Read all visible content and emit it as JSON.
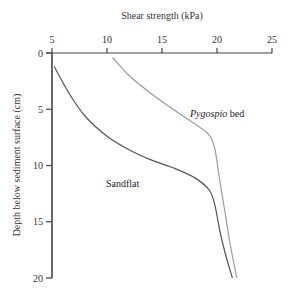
{
  "chart_data": {
    "type": "line",
    "title": "",
    "xlabel": "Shear strength (kPa)",
    "ylabel": "Depth below sediment surface (cm)",
    "xlim": [
      5,
      25
    ],
    "ylim": [
      0,
      20
    ],
    "y_inverted": true,
    "x_axis_position": "top",
    "x_ticks": [
      5,
      10,
      15,
      20,
      25
    ],
    "y_ticks": [
      0,
      5,
      10,
      15,
      20
    ],
    "grid": false,
    "legend": "inline labels",
    "series": [
      {
        "name": "Pygospio bed",
        "label_italic_part": "Pygospio",
        "label_plain_part": " bed",
        "color": "#9a9a9a",
        "points": [
          [
            10.5,
            0.4
          ],
          [
            12,
            2
          ],
          [
            14,
            3.6
          ],
          [
            16,
            5
          ],
          [
            18,
            6.3
          ],
          [
            19.3,
            7.3
          ],
          [
            19.8,
            8.5
          ],
          [
            20.2,
            11
          ],
          [
            20.7,
            14
          ],
          [
            21.2,
            17
          ],
          [
            21.8,
            20
          ]
        ]
      },
      {
        "name": "Sandflat",
        "color": "#555555",
        "points": [
          [
            5.2,
            1.2
          ],
          [
            6.5,
            3.5
          ],
          [
            8,
            5.6
          ],
          [
            10,
            7.4
          ],
          [
            12,
            8.6
          ],
          [
            14,
            9.5
          ],
          [
            16,
            10.2
          ],
          [
            18,
            11.1
          ],
          [
            19.3,
            12.2
          ],
          [
            19.8,
            13.5
          ],
          [
            20.3,
            16
          ],
          [
            20.8,
            18
          ],
          [
            21.4,
            20
          ]
        ]
      }
    ],
    "annotations": [
      {
        "text": "Pygospio bed",
        "x": 19.5,
        "y": 5.5
      },
      {
        "text": "Sandflat",
        "x": 10,
        "y": 11.5
      }
    ]
  }
}
